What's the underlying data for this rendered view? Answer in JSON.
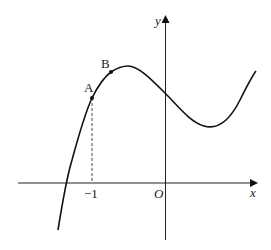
{
  "diagram": {
    "type": "function-graph",
    "axes": {
      "x_label": "x",
      "y_label": "y",
      "origin_label": "O"
    },
    "tick_labels": [
      "−1"
    ],
    "points": [
      {
        "label": "A",
        "note": "on curve at x = -1"
      },
      {
        "label": "B",
        "note": "on curve between A and local maximum"
      }
    ],
    "curve": "cubic with local max left of y-axis and local min right of y-axis",
    "dashed_guide": "vertical from A down to x = -1"
  }
}
